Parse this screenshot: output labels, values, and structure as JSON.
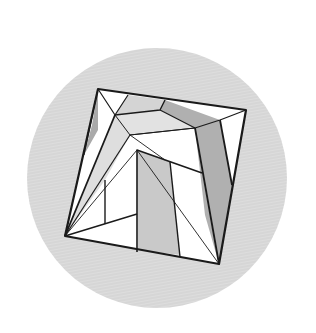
{
  "diagram": {
    "type": "geometric-illustration",
    "colors": {
      "background": "#ffffff",
      "circle": "#d9d9d9",
      "white_face": "#ffffff",
      "light_face": "#dcdcdc",
      "mid_face": "#b4b4b4",
      "stroke": "#1a1a1a"
    },
    "circle": {
      "cx": 157,
      "cy": 178,
      "r": 130
    }
  }
}
